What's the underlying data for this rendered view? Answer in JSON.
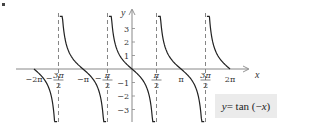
{
  "chart_data": {
    "type": "line",
    "function": "tan(-x)",
    "xlabel": "x",
    "ylabel": "y",
    "xlim": [
      -6.5,
      6.7
    ],
    "ylim": [
      -3.8,
      3.6
    ],
    "x_ticks": [
      {
        "value": -6.2832,
        "label": "−2π"
      },
      {
        "value": -4.7124,
        "label": "−3π/2"
      },
      {
        "value": -3.1416,
        "label": "−π"
      },
      {
        "value": -1.5708,
        "label": "−π/2"
      },
      {
        "value": 1.5708,
        "label": "π/2"
      },
      {
        "value": 3.1416,
        "label": "π"
      },
      {
        "value": 4.7124,
        "label": "3π/2"
      },
      {
        "value": 6.2832,
        "label": "2π"
      }
    ],
    "y_ticks": [
      {
        "value": 3,
        "label": "3"
      },
      {
        "value": 2,
        "label": "2"
      },
      {
        "value": 1,
        "label": "1"
      },
      {
        "value": -1,
        "label": "−1"
      },
      {
        "value": -2,
        "label": "−2"
      },
      {
        "value": -3,
        "label": "−3"
      }
    ],
    "asymptotes": [
      -4.7124,
      -1.5708,
      1.5708,
      4.7124
    ],
    "branches": [
      {
        "x_range": [
          -6.2832,
          -4.8
        ],
        "description": "from 0 at −2π decreasing toward −∞ near −3π/2"
      },
      {
        "x_range": [
          -4.63,
          -1.66
        ],
        "description": "full branch through zero at −π"
      },
      {
        "x_range": [
          -1.48,
          1.48
        ],
        "description": "full branch through origin"
      },
      {
        "x_range": [
          1.66,
          4.63
        ],
        "description": "full branch through zero at π"
      },
      {
        "x_range": [
          4.8,
          6.2832
        ],
        "description": "from +∞ near 3π/2 decreasing to 0 at 2π"
      }
    ],
    "grid": false,
    "legend": null,
    "annotation": "y = tan (−x)"
  },
  "equation": {
    "y": "y",
    "eq": " = tan (−",
    "x": "x",
    "close": ")"
  },
  "colors": {
    "curve": "#222222",
    "axis": "#888888",
    "asymptote": "#777777",
    "label_box": "#ebebeb"
  }
}
